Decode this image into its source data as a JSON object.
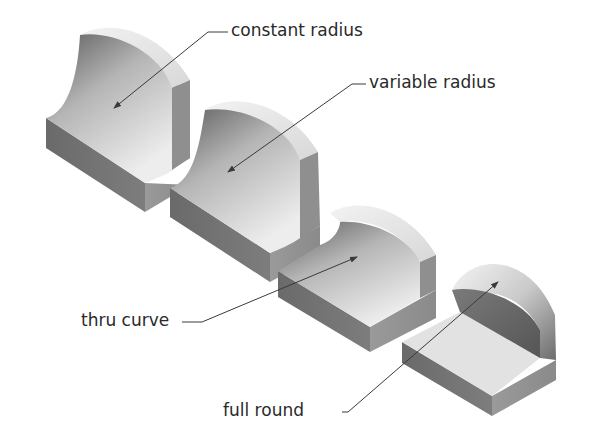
{
  "figure": {
    "background": "#ffffff",
    "line_color": "#3a3a3a"
  },
  "callouts": [
    {
      "id": "constant-radius",
      "label": "constant radius"
    },
    {
      "id": "variable-radius",
      "label": "variable radius"
    },
    {
      "id": "thru-curve",
      "label": "thru curve"
    },
    {
      "id": "full-round",
      "label": "full round"
    }
  ],
  "parts": [
    {
      "id": "part-constant-radius",
      "shape": "block-with-concave-constant-fillet"
    },
    {
      "id": "part-variable-radius",
      "shape": "block-with-concave-variable-fillet"
    },
    {
      "id": "part-thru-curve",
      "shape": "block-with-fillet-thru-curve"
    },
    {
      "id": "part-full-round",
      "shape": "block-with-full-round-wall"
    }
  ]
}
